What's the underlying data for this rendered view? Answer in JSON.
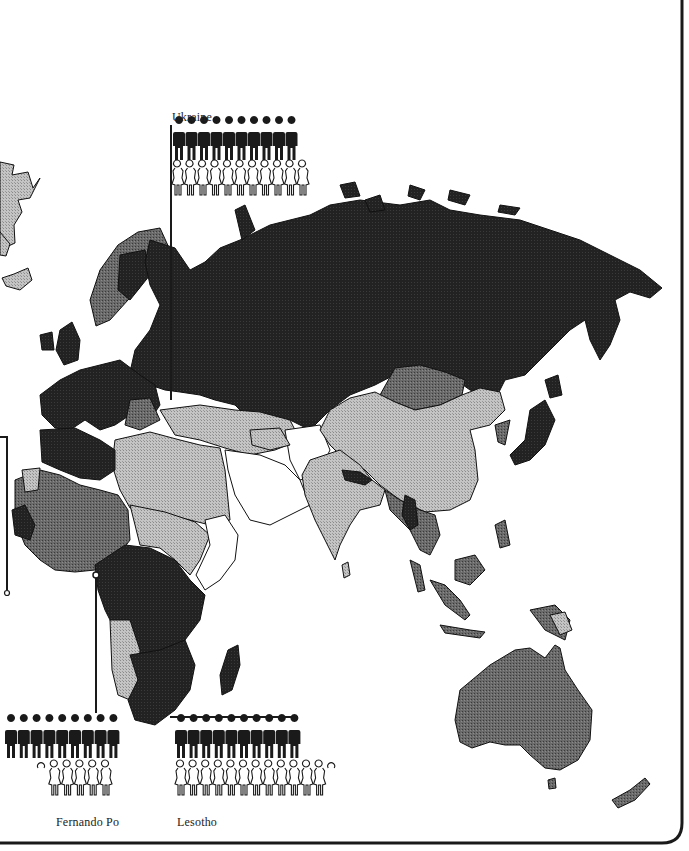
{
  "map": {
    "title": "",
    "colors": {
      "background": "#ffffff",
      "frame": "#1a1a1a",
      "tone_white": "#ffffff",
      "tone_light": "#b3b3b3",
      "tone_medium": "#5c5c5c",
      "tone_dark": "#1e1e1e",
      "outline": "#111111"
    },
    "regions": [
      {
        "name": "Russia / USSR",
        "tone": "dark"
      },
      {
        "name": "Scandinavia",
        "tone": "dark"
      },
      {
        "name": "Western Europe",
        "tone": "dark"
      },
      {
        "name": "Mongolia",
        "tone": "medium"
      },
      {
        "name": "China",
        "tone": "light"
      },
      {
        "name": "India",
        "tone": "light"
      },
      {
        "name": "Nepal",
        "tone": "dark"
      },
      {
        "name": "Arabian Peninsula",
        "tone": "white"
      },
      {
        "name": "North Africa",
        "tone": "light"
      },
      {
        "name": "West Africa",
        "tone": "medium"
      },
      {
        "name": "Central Africa",
        "tone": "dark"
      },
      {
        "name": "Southern Africa",
        "tone": "dark"
      },
      {
        "name": "Madagascar",
        "tone": "dark"
      },
      {
        "name": "Southeast Asia",
        "tone": "medium"
      },
      {
        "name": "Japan",
        "tone": "dark"
      },
      {
        "name": "Indonesia",
        "tone": "medium"
      },
      {
        "name": "Australia",
        "tone": "medium"
      },
      {
        "name": "New Zealand",
        "tone": "medium"
      },
      {
        "name": "Greenland / North America edge",
        "tone": "light"
      }
    ]
  },
  "callouts": [
    {
      "id": "ukraine",
      "label": "Ukraine",
      "males": 10,
      "females": 11,
      "female_partial": 0,
      "position": "top"
    },
    {
      "id": "fernando-po",
      "label": "Fernando Po",
      "males": 9,
      "females": 5,
      "female_partial": 0.3,
      "position": "bottom-left"
    },
    {
      "id": "lesotho",
      "label": "Lesotho",
      "males": 10,
      "females": 12,
      "female_partial": 0.3,
      "position": "bottom"
    }
  ]
}
